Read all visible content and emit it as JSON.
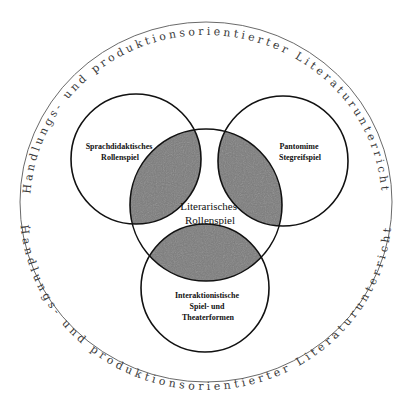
{
  "diagram": {
    "outer_ring": {
      "top_text": "Handlungs- und produktionsorientierter Literaturunterricht",
      "bottom_text": "Handlungs- und produktionsorientierter Literaturunterricht",
      "separator": "·",
      "stroke_color": "#6a6a6a"
    },
    "circles": [
      {
        "id": "sprachdidaktisch",
        "lines": [
          "Sprachdidaktisches",
          "Rollenspiel"
        ]
      },
      {
        "id": "pantomime",
        "lines": [
          "Pantomime",
          "Stegreifspiel"
        ]
      },
      {
        "id": "literarisch",
        "lines": [
          "Literarisches",
          "Rollenspiel"
        ]
      },
      {
        "id": "interaktionistisch",
        "lines": [
          "Interaktionistische",
          "Spiel- und",
          "Theaterformen"
        ]
      }
    ],
    "colors": {
      "overlap_fill": "#7c7c7c",
      "circle_stroke": "#111111",
      "background": "#ffffff"
    }
  }
}
